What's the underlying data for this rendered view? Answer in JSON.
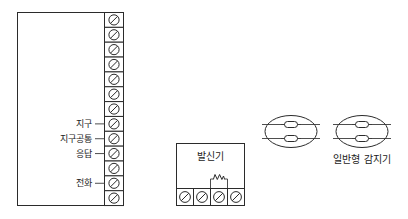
{
  "diagram": {
    "title": "",
    "colors": {
      "stroke": "#2b2b2b",
      "text": "#1a1a1a",
      "background": "#ffffff"
    }
  },
  "panel": {
    "name": "receiver-panel",
    "terminal_count": 13,
    "terminal_symbol": "screw-terminal-slash-circle",
    "labels": [
      {
        "text": "지구",
        "terminal_index": 8
      },
      {
        "text": "지구공통",
        "terminal_index": 9
      },
      {
        "text": "응답",
        "terminal_index": 10
      },
      {
        "text": "전화",
        "terminal_index": 12
      }
    ]
  },
  "transmitter": {
    "name": "transmitter-box",
    "title": "발신기",
    "terminal_count": 4,
    "terminal_symbol": "screw-terminal-slash-circle",
    "resistor": {
      "name": "end-of-line-resistor",
      "symbol": "zigzag-resistor",
      "spans_terminals": [
        3,
        4
      ]
    }
  },
  "detectors": {
    "name": "detector-group",
    "label": "일반형 감지기",
    "count": 2,
    "symbol": "ellipse-detector-two-contacts",
    "items": [
      {
        "name": "detector-1"
      },
      {
        "name": "detector-2"
      }
    ]
  }
}
